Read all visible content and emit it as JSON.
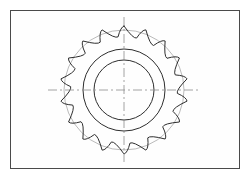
{
  "document": {
    "type": "technical-drawing",
    "subject": "sprocket-gear-wheel",
    "view": "front-elevation",
    "background_color": "#ffffff"
  },
  "frame": {
    "name": "drawing-border",
    "x": 10,
    "y": 10,
    "width": 230,
    "height": 159,
    "stroke_color": "#4a4a4a",
    "stroke_width": 1,
    "fill_color": "#fefefe"
  },
  "geometry": {
    "center_x": 124,
    "center_y": 90,
    "tooth_count": 18,
    "tip_radius": 64,
    "root_radius": 52,
    "valley_radius": 10,
    "construction_circle_radius": 60,
    "hub_outer_radius": 41,
    "hub_inner_radius": 30,
    "bore_radius": 30,
    "tooth_phase_degrees": -90
  },
  "strokes": {
    "outline_color": "#2e2e2e",
    "outline_width": 1,
    "hub_color": "#2e2e2e",
    "hub_width": 1,
    "construction_color": "#a8a8a8",
    "construction_width": 0.8,
    "centerline_color": "#8d8d8d",
    "centerline_width": 0.8,
    "centerline_dash": "9 3 2 3"
  },
  "centerlines": {
    "horizontal": {
      "x1": 48,
      "y1": 90,
      "x2": 200,
      "y2": 90
    },
    "vertical": {
      "x1": 124,
      "y1": 17,
      "x2": 124,
      "y2": 163
    }
  },
  "labels": {
    "title": "",
    "annotations": []
  }
}
